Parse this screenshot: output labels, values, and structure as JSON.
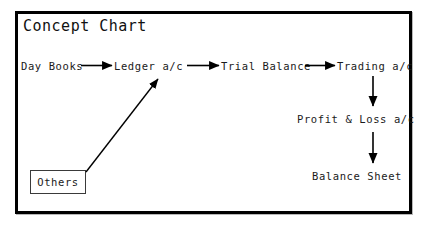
{
  "diagram": {
    "title": "Concept Chart",
    "frame_color": "#000000",
    "text_color": "#1a1a1a",
    "background": "#ffffff",
    "nodes": [
      {
        "id": "day-books",
        "label": "Day Books"
      },
      {
        "id": "ledger",
        "label": "Ledger a/c"
      },
      {
        "id": "trial",
        "label": "Trial Balance"
      },
      {
        "id": "trading",
        "label": "Trading a/c"
      },
      {
        "id": "profit-loss",
        "label": "Profit & Loss a/c"
      },
      {
        "id": "balance",
        "label": "Balance Sheet"
      },
      {
        "id": "others",
        "label": "Others"
      }
    ],
    "edges": [
      {
        "from": "day-books",
        "to": "ledger",
        "style": "solid-arrow",
        "direction": "right"
      },
      {
        "from": "ledger",
        "to": "trial",
        "style": "solid-arrow",
        "direction": "right"
      },
      {
        "from": "trial",
        "to": "trading",
        "style": "solid-arrow",
        "direction": "right"
      },
      {
        "from": "trading",
        "to": "profit-loss",
        "style": "solid-arrow",
        "direction": "down"
      },
      {
        "from": "profit-loss",
        "to": "balance",
        "style": "solid-arrow",
        "direction": "down"
      },
      {
        "from": "others",
        "to": "ledger",
        "style": "solid-arrow",
        "direction": "diagonal-up-right"
      }
    ]
  }
}
